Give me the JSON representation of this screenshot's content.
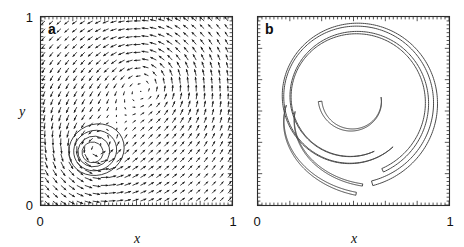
{
  "figure": {
    "background": "#ffffff",
    "width": 464,
    "height": 247
  },
  "panels": [
    {
      "id": "a",
      "letter": "a",
      "xlabel": "x",
      "ylabel": "y",
      "xticklabels": [
        "0",
        "1"
      ],
      "yticklabels": [
        "0",
        "1"
      ],
      "xlim": [
        0,
        1
      ],
      "ylim": [
        0,
        1
      ]
    },
    {
      "id": "b",
      "letter": "b",
      "xlabel": "x",
      "ylabel": "",
      "xticklabels": [
        "0",
        "1"
      ],
      "yticklabels": [],
      "xlim": [
        0,
        1
      ],
      "ylim": [
        0,
        1
      ]
    }
  ],
  "chart_data": [
    {
      "type": "quiver",
      "panel": "a",
      "title": "",
      "xlabel": "x",
      "ylabel": "y",
      "xlim": [
        0,
        1
      ],
      "ylim": [
        0,
        1
      ],
      "xticks": [
        0,
        1
      ],
      "yticks": [
        0,
        1
      ],
      "grid": false,
      "legend": null,
      "description": "Velocity vector field of two co-rotating vortices on a unit square, with streamfunction contours drawn around the lower-left vortex.",
      "vector_field": {
        "grid_nx": 24,
        "grid_ny": 24,
        "arrow_color": "#1a1a1a",
        "vortices": [
          {
            "x": 0.56,
            "y": 0.66,
            "strength": 1.0,
            "core_radius": 0.2
          },
          {
            "x": 0.27,
            "y": 0.28,
            "strength": 0.62,
            "core_radius": 0.1
          }
        ],
        "max_arrow_length_data": 0.045
      },
      "contours": {
        "center": [
          0.27,
          0.28
        ],
        "radii": [
          0.055,
          0.082,
          0.109,
          0.139
        ],
        "color": "#333333",
        "count": 4
      }
    },
    {
      "type": "contour",
      "panel": "b",
      "title": "",
      "xlabel": "x",
      "ylabel": "",
      "xlim": [
        0,
        1
      ],
      "ylim": [
        0,
        1
      ],
      "xticks": [
        0,
        1
      ],
      "yticks": [],
      "grid": false,
      "legend": null,
      "description": "Contour of the deformed vortex patch at a later time: a thin filament wound into roughly one and a half spiral turns with two tapering tails.",
      "filament": {
        "color": "#4a4a4a",
        "line_width": 1.0,
        "turns": 1.6,
        "outer_radius": 0.4,
        "inner_radius": 0.14,
        "spiral_center": [
          0.5,
          0.56
        ],
        "tail_count": 2
      }
    }
  ],
  "labels": {
    "zero": "0",
    "one": "1",
    "x": "x",
    "y": "y",
    "a": "a",
    "b": "b"
  }
}
